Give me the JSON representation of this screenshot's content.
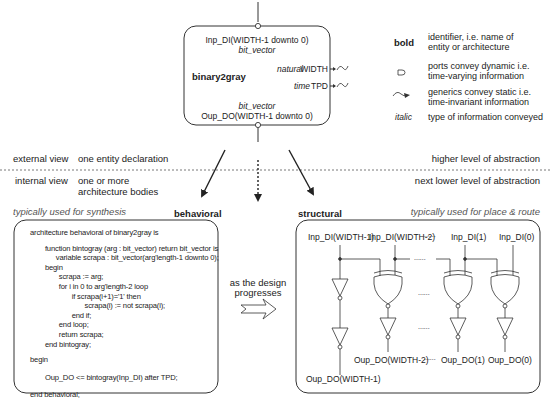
{
  "entity": {
    "input_port": "Inp_DI(WIDTH-1 downto 0)",
    "input_type": "bit_vector",
    "name": "binary2gray",
    "generic_width_type": "natural",
    "generic_width_name": "WIDTH",
    "generic_tpd_type": "time",
    "generic_tpd_name": "TPD",
    "output_type": "bit_vector",
    "output_port": "Oup_DO(WIDTH-1 downto 0)"
  },
  "legend": {
    "items": [
      {
        "symbol": "bold",
        "symbol_icon": "bold-text",
        "line1": "identifier, i.e. name of",
        "line2": "entity or architecture"
      },
      {
        "symbol": "",
        "symbol_icon": "port-icon",
        "line1": "ports convey dynamic i.e.",
        "line2": "time-varying information"
      },
      {
        "symbol": "",
        "symbol_icon": "generic-icon",
        "line1": "generics convey static i.e.",
        "line2": "time-invariant information"
      },
      {
        "symbol": "italic",
        "symbol_icon": "italic-text",
        "line1": "type of information conveyed",
        "line2": ""
      }
    ]
  },
  "views": {
    "external_label": "external view",
    "external_desc": "one entity declaration",
    "external_level": "higher level of abstraction",
    "internal_label": "internal view",
    "internal_desc_line1": "one or more",
    "internal_desc_line2": "architecture bodies",
    "internal_level": "next lower level of abstraction"
  },
  "behavioral": {
    "usage": "typically used for synthesis",
    "title": "behavioral",
    "code": [
      "architecture behavioral of binary2gray is",
      "",
      "   function bintogray (arg : bit_vector) return bit_vector is",
      "      variable scrapa : bit_vector(arg'length-1 downto 0);",
      "   begin",
      "      scrapa := arg;",
      "      for i in 0 to arg'length-2 loop",
      "         if scrapa(i+1)='1' then",
      "            scrapa(i) := not scrapa(i);",
      "         end if;",
      "      end loop;",
      "      return scrapa;",
      "   end bintogray;",
      "",
      "begin",
      "",
      "   Oup_DO <= bintogray(Inp_DI) after TPD;",
      "",
      "end behavioral;"
    ]
  },
  "progress": {
    "line1": "as the design",
    "line2": "progresses"
  },
  "structural": {
    "title": "structural",
    "usage": "typically used for place & route",
    "inputs": [
      "Inp_DI(WIDTH-1)",
      "Inp_DI(WIDTH-2)",
      "Inp_DI(1)",
      "Inp_DI(0)"
    ],
    "outputs": [
      "Oup_DO(WIDTH-1)",
      "Oup_DO(WIDTH-2)",
      "Oup_DO(1)",
      "Oup_DO(0)"
    ],
    "ellipsis": "......"
  }
}
